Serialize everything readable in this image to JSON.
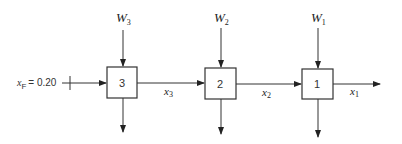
{
  "diagram": {
    "type": "countercurrent multistage process flow",
    "feed": {
      "label": "x",
      "sub": "F",
      "value_text": "= 0.20"
    },
    "stages": [
      {
        "id": "3",
        "label": "3",
        "input_label": "W",
        "input_sub": "3",
        "output_label": "x",
        "output_sub": "3"
      },
      {
        "id": "2",
        "label": "2",
        "input_label": "W",
        "input_sub": "2",
        "output_label": "x",
        "output_sub": "2"
      },
      {
        "id": "1",
        "label": "1",
        "input_label": "W",
        "input_sub": "1",
        "output_label": "x",
        "output_sub": "1"
      }
    ]
  }
}
